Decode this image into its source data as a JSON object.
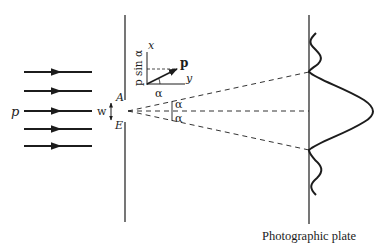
{
  "diagram": {
    "incident_beam": {
      "label": "p",
      "ray_count": 5,
      "ray_ys": [
        72,
        91,
        111,
        129,
        146
      ]
    },
    "slit": {
      "width_label": "w",
      "top_edge_label": "A",
      "bottom_edge_label": "E"
    },
    "momentum_inset": {
      "x_axis_label": "x",
      "y_axis_label": "y",
      "vector_label": "p",
      "angle_label": "α",
      "component_label": "p sin α"
    },
    "angles": {
      "upper_label": "α",
      "lower_label": "α"
    },
    "plate": {
      "caption": "Photographic plate"
    },
    "colors": {
      "ink": "#1c1c1c",
      "background": "#ffffff"
    }
  }
}
